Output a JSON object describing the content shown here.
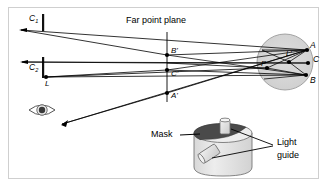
{
  "figure": {
    "background_color": "#ffffff",
    "border_color": "#cfcfcf",
    "ink_color": "#000000",
    "lens_fill_color": "#d6d6d6",
    "mask_fill_color": "#4a4a4a",
    "cylinder_fill_color": "#e2e2e2"
  },
  "labels": {
    "c1": "C",
    "c1_sub": "1",
    "c2": "C",
    "c2_sub": "2",
    "source_l": "L",
    "far_point_plane": "Far point plane",
    "b_prime": "B'",
    "c_prime": "C'",
    "a_prime": "A'",
    "p_point": "P",
    "l_prime": "L'",
    "point_a": "A",
    "point_c": "C",
    "point_b": "B",
    "mask": "Mask",
    "light_guide_line1": "Light",
    "light_guide_line2": "guide"
  },
  "geometry": {
    "far_point_plane_x": 167,
    "aperture_plane_x": 43,
    "lens_center": {
      "x": 285,
      "y": 62
    },
    "lens_radius": 28,
    "points": {
      "B_prime": {
        "x": 167,
        "y": 55
      },
      "C_prime": {
        "x": 167,
        "y": 70
      },
      "A_prime": {
        "x": 167,
        "y": 93
      },
      "L": {
        "x": 46,
        "y": 77
      },
      "P": {
        "x": 267,
        "y": 68
      },
      "L_prime": {
        "x": 289,
        "y": 62
      },
      "A": {
        "x": 307,
        "y": 50
      },
      "C": {
        "x": 308,
        "y": 63
      },
      "B": {
        "x": 306,
        "y": 75
      }
    }
  }
}
